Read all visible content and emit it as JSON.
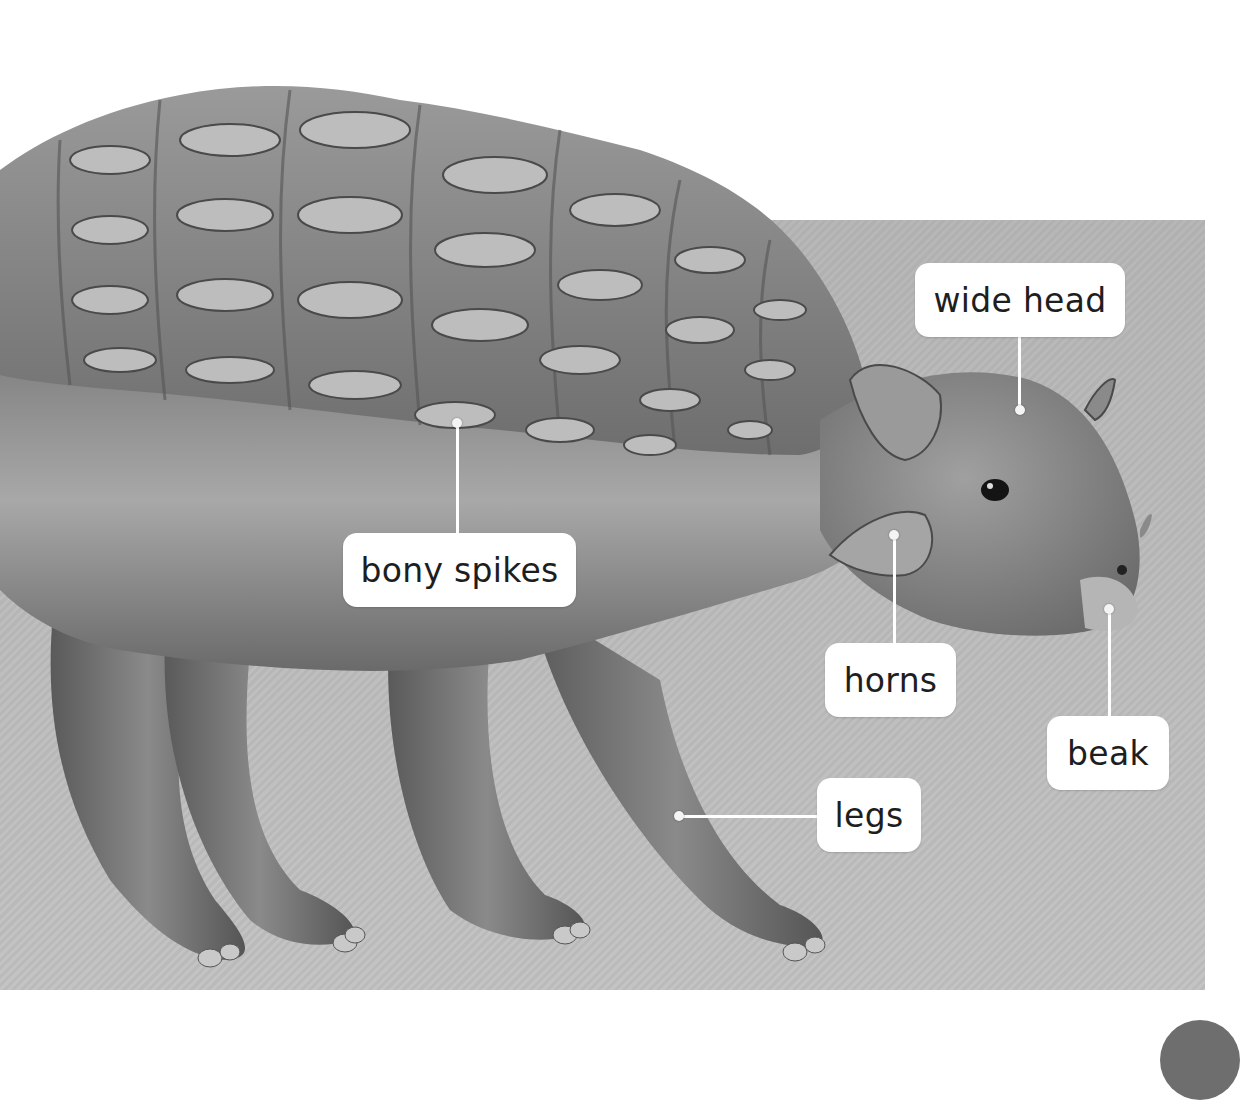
{
  "page": {
    "colors": {
      "background_panel": "#bdbdbd",
      "page_white": "#ffffff",
      "label_bg": "#ffffff",
      "label_text": "#1e1e1e",
      "corner_tab": "#6e6e6e"
    }
  },
  "labels": [
    {
      "id": "wide-head",
      "text": "wide head"
    },
    {
      "id": "bony-spikes",
      "text": "bony spikes"
    },
    {
      "id": "horns",
      "text": "horns"
    },
    {
      "id": "beak",
      "text": "beak"
    },
    {
      "id": "legs",
      "text": "legs"
    }
  ]
}
